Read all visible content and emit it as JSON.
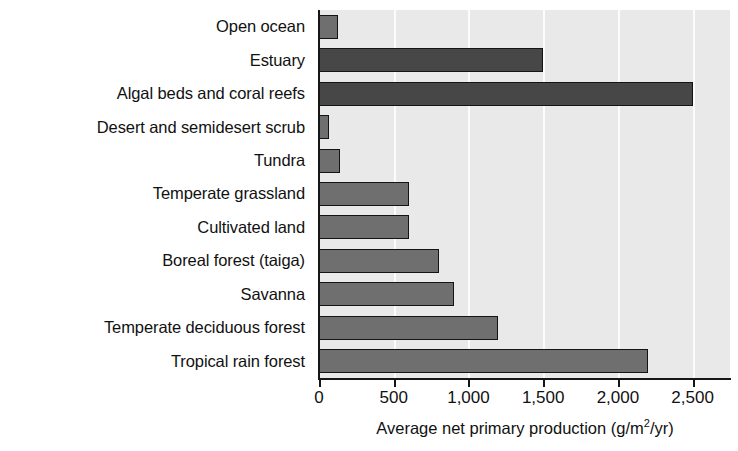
{
  "chart_data": {
    "type": "bar",
    "orientation": "horizontal",
    "title": "",
    "xlabel": "Average net primary production (g/m2/yr)",
    "xlabel_parts": {
      "before": "Average net primary production (g/m",
      "sup": "2",
      "after": "/yr)"
    },
    "ylabel": "",
    "categories": [
      "Open ocean",
      "Estuary",
      "Algal beds and coral reefs",
      "Desert and semidesert scrub",
      "Tundra",
      "Temperate grassland",
      "Cultivated land",
      "Boreal forest (taiga)",
      "Savanna",
      "Temperate deciduous forest",
      "Tropical rain forest"
    ],
    "values": [
      125,
      1500,
      2500,
      70,
      140,
      600,
      600,
      800,
      900,
      1200,
      2200
    ],
    "xlim": [
      0,
      2750
    ],
    "xticks": [
      0,
      500,
      1000,
      1500,
      2000,
      2500
    ],
    "xtick_labels": [
      "0",
      "500",
      "1,000",
      "1,500",
      "2,000",
      "2,500"
    ],
    "grid": true,
    "legend": "none",
    "bar_shades": [
      "medium",
      "dark",
      "dark",
      "medium",
      "medium",
      "medium",
      "medium",
      "medium",
      "medium",
      "medium",
      "medium"
    ],
    "colors": {
      "bar_medium": "#6f6f6f",
      "bar_dark": "#474747",
      "bar_outline": "#141414",
      "plot_background": "#e9e9e9",
      "gridline": "#fcfcfc",
      "axis": "#161616",
      "text": "#111111"
    }
  }
}
